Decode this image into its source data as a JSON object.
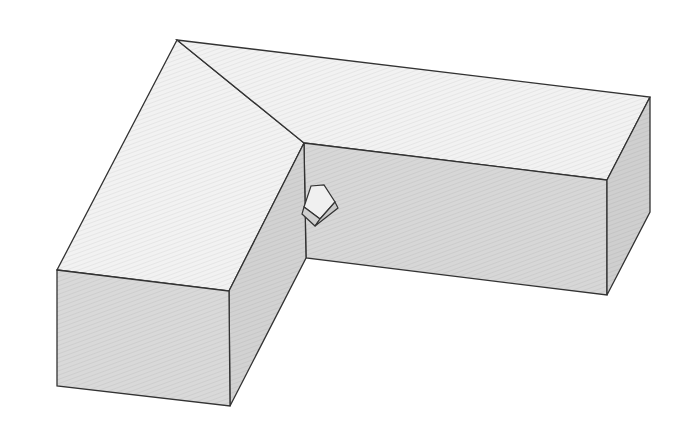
{
  "figure": {
    "colors": {
      "background": "#ffffff",
      "top_face": "#f2f2f2",
      "side_face": "#d4d4d4",
      "front_face": "#d9d9d9",
      "inner_face": "#d7d7d7",
      "edge": "#333333",
      "small_top": "#f0f0f0",
      "small_side": "#c8c8c8"
    }
  }
}
